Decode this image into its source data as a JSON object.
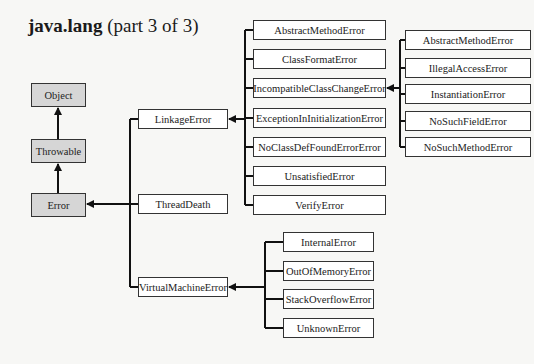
{
  "title": {
    "bold": "java.lang",
    "rest": " (part 3 of 3)"
  },
  "hierarchy": {
    "root": [
      "Object",
      "Throwable",
      "Error"
    ],
    "error_subclasses": [
      "LinkageError",
      "ThreadDeath",
      "VirtualMachineError"
    ],
    "linkage_error_subclasses": [
      "AbstractMethodError",
      "ClassFormatError",
      "IncompatibleClassChangeError",
      "ExceptionInInitializationError",
      "NoClassDefFoundErrorError",
      "UnsatisfiedError",
      "VerifyError"
    ],
    "incompatible_class_change_error_subclasses": [
      "AbstractMethodError",
      "IllegalAccessError",
      "InstantiationError",
      "NoSuchFieldError",
      "NoSuchMethodError"
    ],
    "virtual_machine_error_subclasses": [
      "InternalError",
      "OutOfMemoryError",
      "StackOverflowError",
      "UnknownError"
    ]
  },
  "colors": {
    "root_fill": "#d6d6d6",
    "box_fill": "#ffffff",
    "line": "#111111",
    "background": "#f7f7f5"
  }
}
